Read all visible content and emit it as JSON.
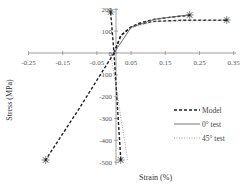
{
  "chart_data": {
    "type": "line",
    "title": "",
    "xlabel": "Strain (%)",
    "ylabel": "Stress (MPa)",
    "xlim": [
      -0.25,
      0.35
    ],
    "ylim": [
      -500,
      200
    ],
    "x_ticks": [
      "-0.25",
      "-0.15",
      "-0.05",
      "0.05",
      "0.15",
      "0.25",
      "0.35"
    ],
    "y_ticks": [
      "200",
      "100",
      "0",
      "-100",
      "-200",
      "-300",
      "-400",
      "-500"
    ],
    "grid": false,
    "legend_position": "lower right",
    "legend": [
      "Model",
      "0° test",
      "45° test"
    ],
    "series": [
      {
        "name": "Model (0° tension)",
        "style": "dashed",
        "x": [
          0,
          0.02,
          0.05,
          0.08,
          0.12,
          0.17,
          0.22
        ],
        "y": [
          0,
          80,
          120,
          140,
          155,
          165,
          172
        ]
      },
      {
        "name": "Model (45° tension)",
        "style": "dashed",
        "x": [
          0,
          0.02,
          0.05,
          0.08,
          0.12,
          0.2,
          0.33
        ],
        "y": [
          0,
          80,
          118,
          135,
          145,
          150,
          150
        ]
      },
      {
        "name": "Model (compression)",
        "style": "dashed",
        "x": [
          0,
          -0.1,
          -0.2
        ],
        "y": [
          0,
          -250,
          -490
        ]
      },
      {
        "name": "Model (0° near-vertical)",
        "style": "dashed",
        "x": [
          0.02,
          0.0,
          -0.01
        ],
        "y": [
          -490,
          0,
          190
        ]
      },
      {
        "name": "0° test",
        "style": "solid",
        "x": [
          0,
          0.05,
          0.12,
          0.22
        ],
        "y": [
          0,
          118,
          155,
          175
        ]
      },
      {
        "name": "45° test",
        "style": "dotted",
        "x": [
          0,
          0.05,
          0.12,
          0.33
        ],
        "y": [
          0,
          115,
          145,
          150
        ]
      },
      {
        "name": "45° test (compression)",
        "style": "dotted",
        "x": [
          -0.01,
          0.04
        ],
        "y": [
          0,
          -490
        ]
      }
    ],
    "markers": [
      {
        "x": -0.01,
        "y": 190,
        "symbol": "asterisk"
      },
      {
        "x": 0.22,
        "y": 172,
        "symbol": "asterisk"
      },
      {
        "x": 0.33,
        "y": 150,
        "symbol": "asterisk"
      },
      {
        "x": -0.2,
        "y": -490,
        "symbol": "asterisk"
      },
      {
        "x": 0.02,
        "y": -490,
        "symbol": "asterisk"
      }
    ]
  }
}
